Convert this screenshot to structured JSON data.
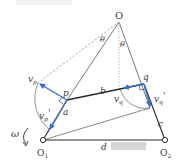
{
  "diagram": {
    "type": "four-bar linkage velocity diagram",
    "labels": {
      "apex": "O",
      "theta_left": "θ",
      "theta_right": "θ",
      "v_p": "v",
      "v_p_sub": "p",
      "v_q": "v",
      "v_q_sub": "q",
      "v_q_prime": "v",
      "v_q_prime_sub": "q",
      "v_q_prime_mark": "'",
      "v_p_prime": "v",
      "v_p_prime_sub": "p",
      "v_p_prime_mark": "'",
      "p": "p",
      "q": "q",
      "a": "a",
      "b": "b",
      "c": "c",
      "d": "d",
      "omega": "ω",
      "O1": "O",
      "O1_sub": "1",
      "O2": "O",
      "O2_sub": "2"
    },
    "colors": {
      "link": "#2b2b2b",
      "thin_line": "#555555",
      "dashed": "#777777",
      "dotted_vertical": "#d9a8a0",
      "arrow": "#2f6fd6",
      "redaction": "#d8d8d8"
    },
    "points": {
      "O": [
        119,
        22
      ],
      "p": [
        67,
        100
      ],
      "q": [
        144,
        84
      ],
      "O1": [
        43,
        140
      ],
      "O2": [
        165,
        140
      ]
    }
  }
}
